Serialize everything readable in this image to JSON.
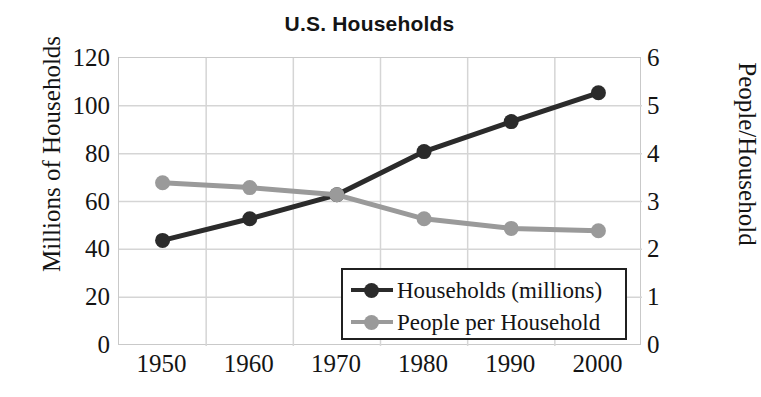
{
  "chart_data": {
    "type": "line",
    "title": "U.S. Households",
    "xlabel": "",
    "ylabel": "Millions of Households",
    "y2label": "People/Household",
    "categories": [
      "1950",
      "1960",
      "1970",
      "1980",
      "1990",
      "2000"
    ],
    "x": [
      1950,
      1960,
      1970,
      1980,
      1990,
      2000
    ],
    "ylim": [
      0,
      120
    ],
    "y2lim": [
      0,
      6
    ],
    "yticks": [
      0,
      20,
      40,
      60,
      80,
      100,
      120
    ],
    "y2ticks": [
      0,
      1,
      2,
      3,
      4,
      5,
      6
    ],
    "ytick_labels": [
      "120",
      "100",
      "80",
      "60",
      "40",
      "20",
      "0"
    ],
    "y2tick_labels": [
      "6",
      "5",
      "4",
      "3",
      "2",
      "1",
      "0"
    ],
    "grid": true,
    "legend_position": "lower-right",
    "series": [
      {
        "name": "Households (millions)",
        "axis": "left",
        "color": "#2b2b2b",
        "marker": "circle",
        "values": [
          44,
          53,
          63,
          81,
          93.5,
          105.5
        ]
      },
      {
        "name": "People per Household",
        "axis": "right",
        "color": "#9a9a9a",
        "marker": "circle",
        "values": [
          3.4,
          3.3,
          3.15,
          2.65,
          2.45,
          2.4
        ]
      }
    ]
  },
  "legend": {
    "items": [
      {
        "label": "Households (millions)",
        "color": "#2b2b2b"
      },
      {
        "label": "People per Household",
        "color": "#9a9a9a"
      }
    ]
  },
  "colors": {
    "households": "#2b2b2b",
    "people_per_household": "#9a9a9a",
    "grid": "#d5d5d5",
    "frame": "#c9c9c9",
    "text": "#141414",
    "background": "#ffffff"
  }
}
